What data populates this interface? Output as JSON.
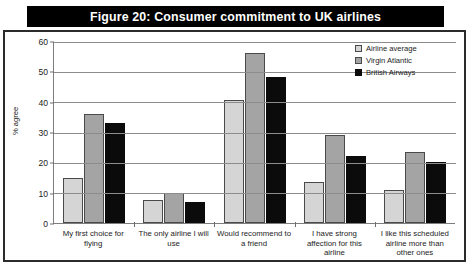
{
  "title": "Figure 20: Consumer commitment to UK airlines",
  "chart_data": {
    "type": "bar",
    "title": "Figure 20: Consumer commitment to UK airlines",
    "xlabel": "",
    "ylabel": "% agree",
    "ylim": [
      0,
      60
    ],
    "yticks": [
      0,
      10,
      20,
      30,
      40,
      50,
      60
    ],
    "grid": true,
    "legend_position": "top-right",
    "categories": [
      "My first choice for flying",
      "The only airline I will use",
      "Would recommend to a friend",
      "I have strong affection for this airline",
      "I like this scheduled airline more than other ones"
    ],
    "series": [
      {
        "name": "Airline average",
        "color": "#d5d5d5",
        "values": [
          15,
          7.5,
          40.5,
          13.5,
          11
        ]
      },
      {
        "name": "Virgin Atlantic",
        "color": "#a4a4a4",
        "values": [
          36,
          10,
          56,
          29,
          23.5
        ]
      },
      {
        "name": "British Airways",
        "color": "#0b0b0b",
        "values": [
          33,
          7,
          48,
          22,
          20
        ]
      }
    ]
  }
}
